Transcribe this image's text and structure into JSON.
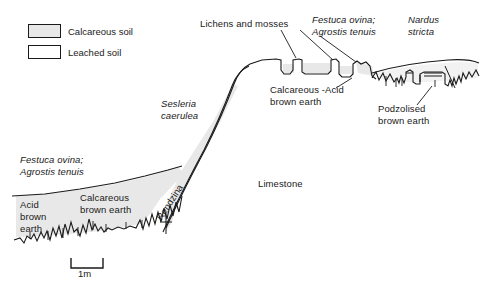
{
  "diagram": {
    "type": "geological-soil-cross-section",
    "width": 486,
    "height": 292,
    "background_color": "#ffffff",
    "line_color": "#1a1a1a",
    "calcareous_fill_color": "#e8e8e8",
    "leached_fill_color": "#ffffff"
  },
  "legend": {
    "items": [
      {
        "label": "Calcareous soil",
        "fill": "#e8e8e8"
      },
      {
        "label": "Leached soil",
        "fill": "#ffffff"
      }
    ]
  },
  "labels": {
    "lichens_mosses": "Lichens and mosses",
    "festuca_agrostis_top_line1": "Festuca ovina;",
    "festuca_agrostis_top_line2": "Agrostis tenuis",
    "nardus_line1": "Nardus",
    "nardus_line2": "stricta",
    "calcareous_acid_line1": "Calcareous -Acid",
    "calcareous_acid_line2": "brown earth",
    "podzolised_line1": "Podzolised",
    "podzolised_line2": "brown earth",
    "sesleria_line1": "Sesleria",
    "sesleria_line2": "caerulea",
    "festuca_agrostis_left_line1": "Festuca ovina;",
    "festuca_agrostis_left_line2": "Agrostis tenuis",
    "acid_brown_earth_line1": "Acid",
    "acid_brown_earth_line2": "brown",
    "acid_brown_earth_line3": "earth",
    "calcareous_brown_earth_line1": "Calcareous",
    "calcareous_brown_earth_line2": "brown earth",
    "rendzina": "Rendzina",
    "limestone": "Limestone"
  },
  "scale": {
    "label": "1m",
    "bar_length_px": 32
  }
}
